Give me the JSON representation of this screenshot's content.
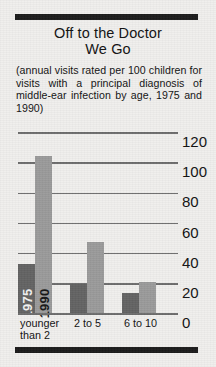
{
  "title": {
    "line1": "Off to the Doctor",
    "line2": "We Go"
  },
  "subtitle": "(annual visits rated per 100 children for visits with a principal diagnosis of middle-ear infection by age, 1975 and 1990)",
  "colors": {
    "background": "#f0efed",
    "rule": "#1b1b1b",
    "gridline": "#6d6d6d",
    "bar_1975": "#636363",
    "bar_1990": "#9a9a9a"
  },
  "chart_data": {
    "type": "bar",
    "title": "Off to the Doctor We Go",
    "subtitle": "(annual visits rated per 100 children for visits with a principal diagnosis of middle-ear infection by age, 1975 and 1990)",
    "categories": [
      "younger\nthan 2",
      "2 to 5",
      "6 to 10"
    ],
    "series": [
      {
        "name": "1975",
        "values": [
          33,
          20,
          14
        ],
        "color": "#636363"
      },
      {
        "name": "1990",
        "values": [
          105,
          48,
          21
        ],
        "color": "#9a9a9a"
      }
    ],
    "xlabel": "",
    "ylabel": "",
    "ylim": [
      0,
      120
    ],
    "yticks": [
      0,
      20,
      40,
      60,
      80,
      100,
      120
    ],
    "ytick_labels": [
      "0",
      "20",
      "40",
      "60",
      "80",
      "100",
      "120"
    ],
    "y_axis_position": "right",
    "grid": true,
    "legend": "in-bar vertical labels on first group"
  }
}
